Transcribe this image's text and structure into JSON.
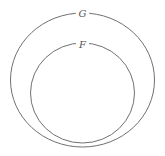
{
  "diagram": {
    "type": "venn-subset",
    "sets": [
      {
        "label": "G",
        "role": "outer"
      },
      {
        "label": "F",
        "role": "inner"
      }
    ],
    "stroke_color": "#707070",
    "background": "#ffffff"
  }
}
